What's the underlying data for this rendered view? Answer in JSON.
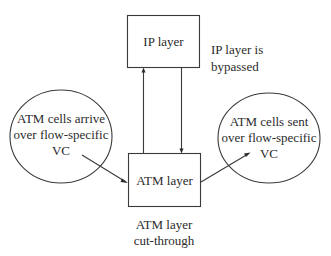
{
  "diagram": {
    "nodes": {
      "ip_layer": {
        "label": "IP layer"
      },
      "atm_layer": {
        "label": "ATM layer"
      },
      "arrive_circle": {
        "lines": [
          "ATM cells arrive",
          "over flow-specific",
          "VC"
        ]
      },
      "sent_circle": {
        "lines": [
          "ATM cells sent",
          "over flow-specific",
          "VC"
        ]
      }
    },
    "annotations": {
      "bypass": {
        "lines": [
          "IP layer is",
          "bypassed"
        ]
      },
      "cut_through": {
        "lines": [
          "ATM layer",
          "cut-through"
        ]
      }
    },
    "edges": [
      {
        "from": "arrive_circle",
        "to": "atm_layer"
      },
      {
        "from": "atm_layer",
        "to": "ip_layer"
      },
      {
        "from": "ip_layer",
        "to": "atm_layer"
      },
      {
        "from": "atm_layer",
        "to": "sent_circle"
      }
    ],
    "colors": {
      "stroke": "#3a3a3a",
      "text": "#2b2b2b",
      "background": "#ffffff"
    }
  }
}
